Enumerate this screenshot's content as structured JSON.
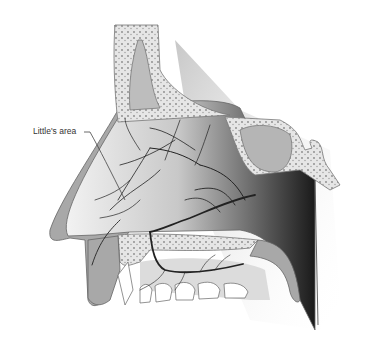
{
  "diagram": {
    "type": "anatomical-illustration",
    "labels": [
      {
        "text": "Little's area",
        "x": 33,
        "y": 130
      }
    ],
    "colors": {
      "background": "#ffffff",
      "bone_fill": "#e8e8e8",
      "bone_outline": "#777777",
      "mucosa": "#a9a9a9",
      "septum_light": "#eeeeee",
      "septum_dark": "#1e1e1e",
      "vessels": "#222222",
      "teeth": "#ffffff"
    }
  }
}
